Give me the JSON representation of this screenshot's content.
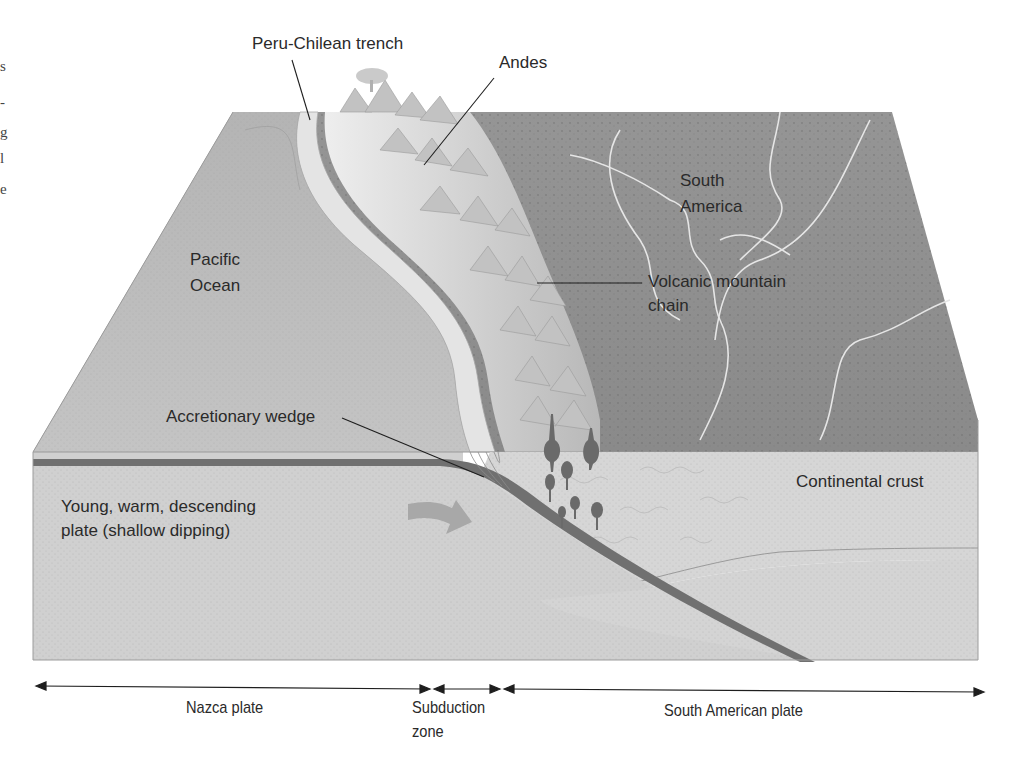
{
  "diagram": {
    "labels": {
      "trench": "Peru-Chilean trench",
      "andes": "Andes",
      "south_america_1": "South",
      "south_america_2": "America",
      "pacific_1": "Pacific",
      "pacific_2": "Ocean",
      "volcanic_1": "Volcanic mountain",
      "volcanic_2": "chain",
      "wedge": "Accretionary wedge",
      "plate_desc_1": "Young, warm, descending",
      "plate_desc_2": "plate (shallow dipping)",
      "continental_crust": "Continental crust"
    },
    "extent_bar": {
      "nazca": "Nazca plate",
      "subduction_1": "Subduction",
      "subduction_2": "zone",
      "south_american": "South American plate"
    },
    "edge_fragments": [
      "s",
      "-",
      "g",
      "l",
      "e"
    ],
    "colors": {
      "ocean_top": "#b9b9b9",
      "land_top": "#8e8e8e",
      "mountains": "#d8d8d8",
      "crust_front": "#c9c9c9",
      "mantle_front": "#d2d2d2",
      "slab": "#707070",
      "magma": "#6a6a6a",
      "arrow": "#a5a5a5",
      "line": "#1e1e1e"
    }
  }
}
